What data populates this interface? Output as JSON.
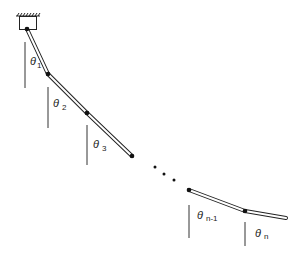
{
  "diagram": {
    "type": "n-link pendulum",
    "colors": {
      "stroke": "#222222",
      "background": "#ffffff"
    },
    "support": {
      "label": "fixed pivot"
    },
    "angles": [
      {
        "symbol": "θ",
        "subscript": "1"
      },
      {
        "symbol": "θ",
        "subscript": "2"
      },
      {
        "symbol": "θ",
        "subscript": "3"
      },
      {
        "symbol": "θ",
        "subscript": "n-1"
      },
      {
        "symbol": "θ",
        "subscript": "n"
      }
    ],
    "ellipsis": "..."
  }
}
